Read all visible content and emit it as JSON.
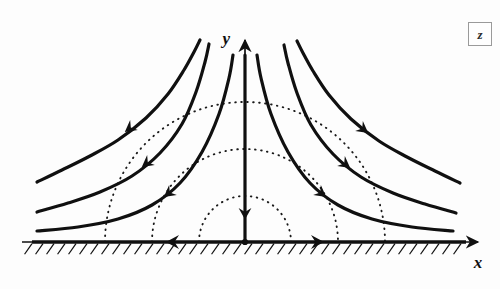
{
  "figure": {
    "background_color": "#fdfdfd",
    "ink_color": "#101010",
    "dotted_color": "#1a1a1a"
  },
  "axes": {
    "x_label": "x",
    "y_label": "y",
    "origin": {
      "x": 245,
      "y": 242
    },
    "x_axis": {
      "start_x": 22,
      "end_x": 478,
      "y": 242,
      "arrow": "right"
    },
    "y_axis": {
      "x": 245,
      "start_y": 242,
      "end_y": 40,
      "arrow": "up"
    },
    "hatching": {
      "from_x": 32,
      "to_x": 466,
      "spacing": 11,
      "length": 13,
      "angle_deg": 55
    }
  },
  "badge": {
    "label": "z",
    "border_color": "#9a9a9a"
  },
  "chart_data": {
    "type": "line",
    "xlabel": "x",
    "ylabel": "y",
    "grid": false,
    "legend": null,
    "series": [
      {
        "name": "streamline-far-left",
        "style": "solid",
        "constant": "xy = k6 (largest)",
        "points": [
          [
            37,
            182
          ],
          [
            62,
            170
          ],
          [
            90,
            156
          ],
          [
            118,
            140
          ],
          [
            146,
            118
          ],
          [
            168,
            94
          ],
          [
            184,
            70
          ],
          [
            194,
            52
          ],
          [
            200,
            40
          ]
        ],
        "arrow_at": [
          126,
          131
        ],
        "arrow_direction": "down-left"
      },
      {
        "name": "streamline-mid-left",
        "style": "solid",
        "constant": "xy = k5",
        "points": [
          [
            37,
            212
          ],
          [
            68,
            203
          ],
          [
            100,
            192
          ],
          [
            132,
            176
          ],
          [
            160,
            153
          ],
          [
            182,
            124
          ],
          [
            196,
            92
          ],
          [
            205,
            62
          ],
          [
            209,
            44
          ]
        ],
        "arrow_at": [
          143,
          166
        ],
        "arrow_direction": "down-left"
      },
      {
        "name": "streamline-inner-left",
        "style": "solid",
        "constant": "xy = k4",
        "points": [
          [
            37,
            231
          ],
          [
            78,
            227
          ],
          [
            118,
            219
          ],
          [
            152,
            205
          ],
          [
            180,
            183
          ],
          [
            202,
            152
          ],
          [
            219,
            114
          ],
          [
            229,
            78
          ],
          [
            233,
            55
          ]
        ],
        "arrow_at": [
          165,
          196
        ],
        "arrow_direction": "down-left"
      },
      {
        "name": "streamline-axis-down",
        "style": "solid",
        "constant": "x = 0 (stagnation streamline)",
        "points": [
          [
            245,
            55
          ],
          [
            245,
            242
          ]
        ],
        "arrow_at": [
          245,
          218
        ],
        "arrow_direction": "down"
      },
      {
        "name": "streamline-inner-right",
        "style": "solid",
        "constant": "xy = -k4",
        "points": [
          [
            453,
            231
          ],
          [
            412,
            227
          ],
          [
            372,
            219
          ],
          [
            338,
            205
          ],
          [
            310,
            183
          ],
          [
            288,
            152
          ],
          [
            271,
            114
          ],
          [
            261,
            78
          ],
          [
            257,
            55
          ]
        ],
        "arrow_at": [
          325,
          196
        ],
        "arrow_direction": "down-right"
      },
      {
        "name": "streamline-mid-right",
        "style": "solid",
        "constant": "xy = -k5",
        "points": [
          [
            456,
            213
          ],
          [
            425,
            204
          ],
          [
            393,
            193
          ],
          [
            361,
            177
          ],
          [
            333,
            154
          ],
          [
            311,
            125
          ],
          [
            297,
            93
          ],
          [
            288,
            63
          ],
          [
            284,
            45
          ]
        ],
        "arrow_at": [
          349,
          167
        ],
        "arrow_direction": "down-right"
      },
      {
        "name": "streamline-far-right",
        "style": "solid",
        "constant": "xy = -k6 (largest)",
        "points": [
          [
            460,
            183
          ],
          [
            435,
            171
          ],
          [
            407,
            157
          ],
          [
            379,
            141
          ],
          [
            351,
            119
          ],
          [
            329,
            95
          ],
          [
            313,
            71
          ],
          [
            303,
            53
          ],
          [
            297,
            41
          ]
        ],
        "arrow_at": [
          367,
          132
        ],
        "arrow_direction": "down-right"
      }
    ],
    "equipotentials": [
      {
        "name": "equipotential-inner",
        "style": "dotted",
        "radius": 46
      },
      {
        "name": "equipotential-middle",
        "style": "dotted",
        "radius": 93
      },
      {
        "name": "equipotential-outer",
        "style": "dotted",
        "radius": 140
      }
    ],
    "wall_arrows": [
      {
        "name": "wall-arrow-left",
        "x": 168,
        "y": 242,
        "direction": "left"
      },
      {
        "name": "wall-arrow-right",
        "x": 322,
        "y": 242,
        "direction": "right"
      }
    ]
  }
}
